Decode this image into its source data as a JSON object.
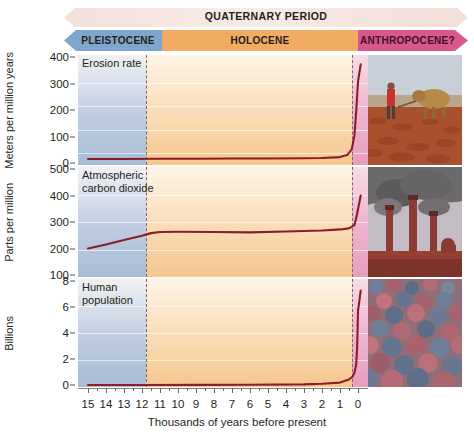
{
  "timeline": {
    "period_label": "QUATERNARY PERIOD",
    "epochs": [
      {
        "label": "PLEISTOCENE",
        "color": "#7fa6cc"
      },
      {
        "label": "HOLOCENE",
        "color": "#f2ab63"
      },
      {
        "label": "ANTHROPOCENE?",
        "color": "#d9578f"
      }
    ]
  },
  "xaxis": {
    "title": "Thousands of years before present",
    "ticks": [
      "15",
      "14",
      "13",
      "12",
      "11",
      "10",
      "9",
      "8",
      "7",
      "6",
      "5",
      "4",
      "3",
      "2",
      "1",
      "0"
    ]
  },
  "panels": [
    {
      "title": "Erosion rate",
      "ylabel": "Meters per million years",
      "yticks": [
        "400",
        "300",
        "200",
        "100",
        "0"
      ],
      "photo_name": "plowing-field-photo",
      "photo_caption": "farmer plowing field with oxen"
    },
    {
      "title": "Atmospheric\ncarbon dioxide",
      "ylabel": "Parts per million",
      "yticks": [
        "500",
        "400",
        "300",
        "200",
        "100"
      ],
      "photo_name": "smokestacks-photo",
      "photo_caption": "industrial smokestacks emitting smoke"
    },
    {
      "title": "Human\npopulation",
      "ylabel": "Billions",
      "yticks": [
        "8",
        "6",
        "4",
        "2",
        "0"
      ],
      "photo_name": "crowd-photo",
      "photo_caption": "dense crowd of people"
    }
  ],
  "chart_data": [
    {
      "type": "line",
      "title": "Erosion rate",
      "xlabel": "Thousands of years before present",
      "ylabel": "Meters per million years",
      "xlim": [
        15,
        -0.6
      ],
      "ylim": [
        0,
        430
      ],
      "yticks": [
        0,
        100,
        200,
        300,
        400
      ],
      "xticks": [
        15,
        14,
        13,
        12,
        11,
        10,
        9,
        8,
        7,
        6,
        5,
        4,
        3,
        2,
        1,
        0
      ],
      "grid": true,
      "line_color": "#8c1d28",
      "x": [
        15,
        13,
        11,
        9,
        7,
        5,
        3,
        2,
        1,
        0.6,
        0.35,
        0.2,
        0.1,
        0.0,
        -0.15
      ],
      "values": [
        16,
        16,
        17,
        17,
        18,
        18,
        19,
        20,
        24,
        32,
        55,
        110,
        210,
        330,
        400
      ]
    },
    {
      "type": "line",
      "title": "Atmospheric carbon dioxide",
      "xlabel": "Thousands of years before present",
      "ylabel": "Parts per million",
      "xlim": [
        15,
        -0.6
      ],
      "ylim": [
        100,
        500
      ],
      "yticks": [
        100,
        200,
        300,
        400,
        500
      ],
      "xticks": [
        15,
        14,
        13,
        12,
        11,
        10,
        9,
        8,
        7,
        6,
        5,
        4,
        3,
        2,
        1,
        0
      ],
      "grid": true,
      "line_color": "#8c1d28",
      "x": [
        15,
        14,
        13,
        12,
        11.5,
        11,
        10,
        8,
        6,
        4,
        2,
        1,
        0.5,
        0.2,
        0.05,
        -0.15
      ],
      "values": [
        200,
        215,
        232,
        248,
        258,
        262,
        263,
        262,
        261,
        264,
        268,
        272,
        276,
        288,
        330,
        400
      ]
    },
    {
      "type": "line",
      "title": "Human population",
      "xlabel": "Thousands of years before present",
      "ylabel": "Billions",
      "xlim": [
        15,
        -0.6
      ],
      "ylim": [
        0,
        8.6
      ],
      "yticks": [
        0,
        2,
        4,
        6,
        8
      ],
      "xticks": [
        15,
        14,
        13,
        12,
        11,
        10,
        9,
        8,
        7,
        6,
        5,
        4,
        3,
        2,
        1,
        0
      ],
      "grid": true,
      "line_color": "#8c1d28",
      "x": [
        15,
        12,
        9,
        6,
        3,
        2,
        1,
        0.5,
        0.3,
        0.2,
        0.1,
        0.05,
        0.0,
        -0.15
      ],
      "values": [
        0.004,
        0.005,
        0.007,
        0.02,
        0.05,
        0.1,
        0.2,
        0.45,
        0.7,
        1.0,
        1.7,
        3.0,
        6.1,
        7.8
      ]
    }
  ]
}
